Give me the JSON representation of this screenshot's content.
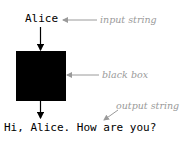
{
  "diagram": {
    "input_value": "Alice",
    "output_value": "Hi, Alice. How are you?",
    "labels": {
      "input": "input string",
      "box": "black box",
      "output": "output string"
    },
    "colors": {
      "box": "#000000",
      "annotation": "#9a9a9a"
    }
  }
}
